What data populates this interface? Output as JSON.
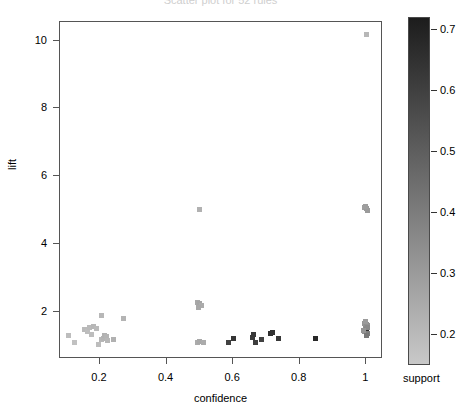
{
  "chart_data": {
    "type": "scatter",
    "title": "Scatter plot for 52 rules",
    "xlabel": "confidence",
    "ylabel": "lift",
    "xlim": [
      0.08,
      1.05
    ],
    "ylim": [
      0.6,
      10.55
    ],
    "xticks": [
      0.2,
      0.4,
      0.6,
      0.8,
      1
    ],
    "xtick_labels": [
      "0.2",
      "0.4",
      "0.6",
      "0.8",
      "1"
    ],
    "yticks": [
      2,
      4,
      6,
      8,
      10
    ],
    "ytick_labels": [
      "2",
      "4",
      "6",
      "8",
      "10"
    ],
    "grid": false,
    "marker": "square",
    "colorbar": {
      "label": "support",
      "ticks": [
        0.2,
        0.3,
        0.4,
        0.5,
        0.6,
        0.7
      ],
      "tick_labels": [
        "0.2",
        "0.3",
        "0.4",
        "0.5",
        "0.6",
        "0.7"
      ],
      "vmin": 0.15,
      "vmax": 0.72,
      "high_color": "#1c1c1c",
      "low_color": "#c8c8c8",
      "orientation": "vertical",
      "position": "right"
    },
    "color_series": "support",
    "points": [
      {
        "confidence": 0.105,
        "lift": 1.28,
        "support": 0.2
      },
      {
        "confidence": 0.125,
        "lift": 1.1,
        "support": 0.19
      },
      {
        "confidence": 0.155,
        "lift": 1.46,
        "support": 0.21
      },
      {
        "confidence": 0.163,
        "lift": 1.4,
        "support": 0.2
      },
      {
        "confidence": 0.168,
        "lift": 1.52,
        "support": 0.21
      },
      {
        "confidence": 0.176,
        "lift": 1.33,
        "support": 0.2
      },
      {
        "confidence": 0.182,
        "lift": 1.55,
        "support": 0.22
      },
      {
        "confidence": 0.189,
        "lift": 1.5,
        "support": 0.21
      },
      {
        "confidence": 0.195,
        "lift": 1.03,
        "support": 0.2
      },
      {
        "confidence": 0.205,
        "lift": 1.18,
        "support": 0.22
      },
      {
        "confidence": 0.211,
        "lift": 1.22,
        "support": 0.23
      },
      {
        "confidence": 0.215,
        "lift": 1.3,
        "support": 0.24
      },
      {
        "confidence": 0.219,
        "lift": 1.26,
        "support": 0.23
      },
      {
        "confidence": 0.222,
        "lift": 1.14,
        "support": 0.22
      },
      {
        "confidence": 0.206,
        "lift": 1.88,
        "support": 0.22
      },
      {
        "confidence": 0.241,
        "lift": 1.19,
        "support": 0.24
      },
      {
        "confidence": 0.272,
        "lift": 1.79,
        "support": 0.23
      },
      {
        "confidence": 0.499,
        "lift": 5.02,
        "support": 0.24
      },
      {
        "confidence": 0.493,
        "lift": 2.27,
        "support": 0.27
      },
      {
        "confidence": 0.5,
        "lift": 2.24,
        "support": 0.28
      },
      {
        "confidence": 0.506,
        "lift": 2.19,
        "support": 0.26
      },
      {
        "confidence": 0.497,
        "lift": 2.12,
        "support": 0.27
      },
      {
        "confidence": 0.492,
        "lift": 1.09,
        "support": 0.26
      },
      {
        "confidence": 0.5,
        "lift": 1.12,
        "support": 0.27
      },
      {
        "confidence": 0.511,
        "lift": 1.1,
        "support": 0.26
      },
      {
        "confidence": 0.585,
        "lift": 1.09,
        "support": 0.6
      },
      {
        "confidence": 0.602,
        "lift": 1.22,
        "support": 0.64
      },
      {
        "confidence": 0.657,
        "lift": 1.24,
        "support": 0.62
      },
      {
        "confidence": 0.661,
        "lift": 1.31,
        "support": 0.63
      },
      {
        "confidence": 0.668,
        "lift": 1.1,
        "support": 0.61
      },
      {
        "confidence": 0.685,
        "lift": 1.17,
        "support": 0.6
      },
      {
        "confidence": 0.712,
        "lift": 1.36,
        "support": 0.66
      },
      {
        "confidence": 0.719,
        "lift": 1.38,
        "support": 0.65
      },
      {
        "confidence": 0.735,
        "lift": 1.2,
        "support": 0.63
      },
      {
        "confidence": 0.846,
        "lift": 1.21,
        "support": 0.68
      },
      {
        "confidence": 0.999,
        "lift": 10.18,
        "support": 0.22
      },
      {
        "confidence": 0.995,
        "lift": 5.07,
        "support": 0.3
      },
      {
        "confidence": 1.0,
        "lift": 5.04,
        "support": 0.32
      },
      {
        "confidence": 1.002,
        "lift": 4.98,
        "support": 0.31
      },
      {
        "confidence": 0.996,
        "lift": 5.1,
        "support": 0.3
      },
      {
        "confidence": 0.993,
        "lift": 1.66,
        "support": 0.33
      },
      {
        "confidence": 0.999,
        "lift": 1.62,
        "support": 0.35
      },
      {
        "confidence": 1.003,
        "lift": 1.58,
        "support": 0.34
      },
      {
        "confidence": 0.996,
        "lift": 1.5,
        "support": 0.36
      },
      {
        "confidence": 1.001,
        "lift": 1.46,
        "support": 0.38
      },
      {
        "confidence": 0.994,
        "lift": 1.42,
        "support": 0.35
      },
      {
        "confidence": 1.0,
        "lift": 1.38,
        "support": 0.66
      },
      {
        "confidence": 1.004,
        "lift": 1.34,
        "support": 0.4
      },
      {
        "confidence": 0.997,
        "lift": 1.7,
        "support": 0.31
      },
      {
        "confidence": 1.002,
        "lift": 1.54,
        "support": 0.37
      },
      {
        "confidence": 0.991,
        "lift": 1.44,
        "support": 0.33
      },
      {
        "confidence": 1.0,
        "lift": 1.3,
        "support": 0.42
      }
    ]
  }
}
